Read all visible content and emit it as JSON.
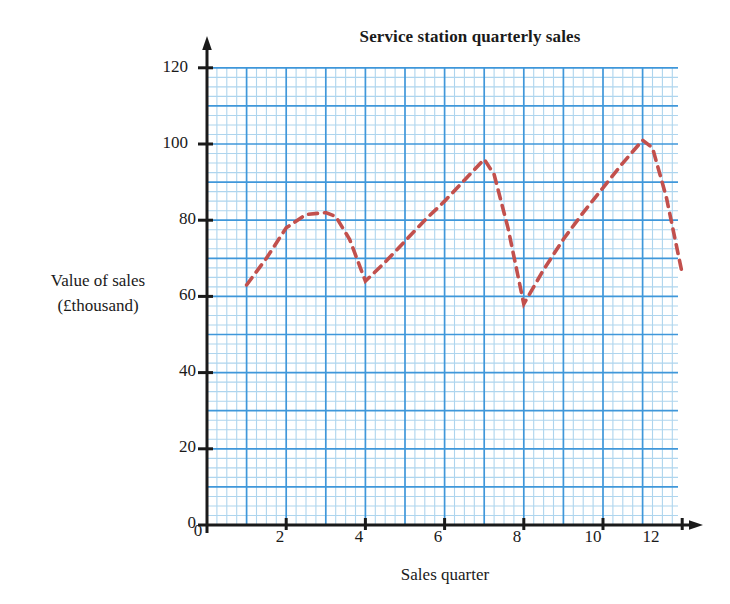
{
  "chart_data": {
    "type": "line",
    "title": "Service station quarterly sales",
    "xlabel": "Sales quarter",
    "ylabel_line1": "Value of sales",
    "ylabel_line2": "(£thousand)",
    "xlim": [
      0,
      12.6
    ],
    "ylim": [
      0,
      124
    ],
    "xticks": [
      "0",
      "2",
      "4",
      "6",
      "8",
      "10",
      "12"
    ],
    "xtick_values": [
      0,
      2,
      4,
      6,
      8,
      10,
      12
    ],
    "yticks": [
      "0",
      "20",
      "40",
      "60",
      "80",
      "100",
      "120"
    ],
    "ytick_values": [
      0,
      20,
      40,
      60,
      80,
      100,
      120
    ],
    "grid": "on",
    "grid_major_step_x": 1,
    "grid_minor_step_x": 0.25,
    "grid_major_step_y": 10,
    "grid_minor_step_y": 2.5,
    "legend": "none",
    "series": [
      {
        "name": "Quarterly sales trend",
        "style": "dashed",
        "color": "#c2504d",
        "x": [
          1,
          1.5,
          2,
          2.5,
          3,
          3.25,
          3.6,
          4,
          4.5,
          5,
          5.5,
          6,
          6.5,
          7,
          7.25,
          7.6,
          8,
          8.5,
          9,
          9.5,
          10,
          10.5,
          11,
          11.25,
          11.6,
          12
        ],
        "values": [
          63,
          70,
          78,
          81.5,
          82,
          81,
          75,
          64,
          69,
          74.5,
          80,
          85,
          90.5,
          96,
          92,
          78,
          58,
          67,
          75,
          82,
          88.5,
          95,
          101,
          99,
          86,
          66
        ]
      }
    ],
    "annotations": []
  },
  "axes": {
    "x_axis_name": "x-axis",
    "y_axis_name": "y-axis",
    "arrow": "true"
  }
}
